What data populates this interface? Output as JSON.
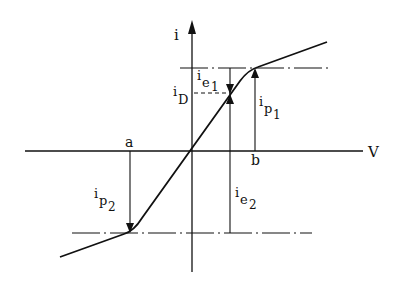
{
  "diagram": {
    "axes": {
      "y_label": "i",
      "x_label": "V"
    },
    "points": {
      "a": "a",
      "b": "b"
    },
    "labels": {
      "ie1": {
        "base": "i",
        "sub": "e",
        "subsub": "1"
      },
      "iD": {
        "base": "i",
        "sub": "D"
      },
      "ip1": {
        "base": "i",
        "sub": "p",
        "subsub": "1"
      },
      "ip2": {
        "base": "i",
        "sub": "p",
        "subsub": "2"
      },
      "ie2": {
        "base": "i",
        "sub": "e",
        "subsub": "2"
      }
    },
    "colors": {
      "line": "#111111",
      "background": "#ffffff"
    }
  }
}
